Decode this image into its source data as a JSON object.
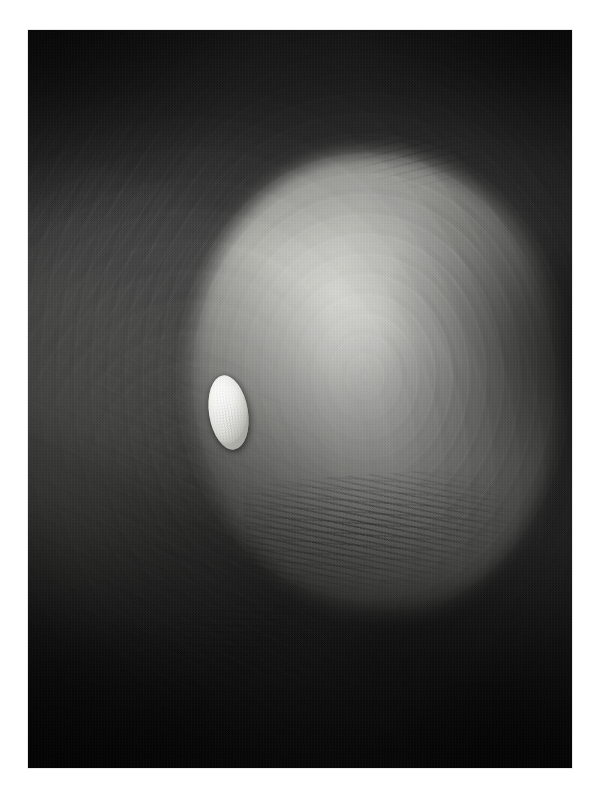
{
  "page": {
    "background_color": "#ffffff",
    "width": 603,
    "height": 795,
    "margins": {
      "left": 28,
      "top": 30,
      "right": 31,
      "bottom": 27
    }
  },
  "artwork": {
    "title": "",
    "medium_appearance": "grayscale photographic reproduction",
    "plate": {
      "x": 28,
      "y": 30,
      "width": 544,
      "height": 738,
      "border_color": "#9a9a9a"
    },
    "palette": {
      "deep_shadow": "#0e0e0e",
      "dark_field": "#242424",
      "mid_gray": "#6a6a67",
      "light_gray": "#aeaea9",
      "highlight_gray": "#d8d8d4",
      "pebble_white": "#ffffff",
      "paper_white": "#ffffff"
    },
    "elements": [
      {
        "name": "dark-upper-field",
        "description": "Deep charcoal field occupying the top third, darkest in both upper corners",
        "tone": "#1d1d1d"
      },
      {
        "name": "bright-lobe",
        "description": "Large rounded luminous mass, right of centre, with a crisp dark rim on its right edge",
        "tone": "#cfcfca",
        "center_pct": {
          "x": 64,
          "y": 48
        },
        "size_pct": {
          "w": 68,
          "h": 62
        }
      },
      {
        "name": "vortex-rings",
        "description": "Concentric elliptical brush-stroke rings sweeping around the hollow",
        "tone": "#555552"
      },
      {
        "name": "lower-left-streaks",
        "description": "Diagonal sweeping light streaks curling through the lower-left quadrant",
        "tone": "#b5b5b0"
      },
      {
        "name": "scratch-marks",
        "description": "Fine dark scratchy striations along the lower arc of the bright lobe",
        "tone": "#1a1a1a"
      },
      {
        "name": "shadow-wedge",
        "description": "Deep black diagonal wedge filling the lower-right corner",
        "tone": "#0a0a0a"
      },
      {
        "name": "white-pebble",
        "description": "Small bright white tilted ellipse floating left of centre, speckled, casting a soft shadow",
        "tone": "#ffffff",
        "center_pct": {
          "x": 37,
          "y": 52
        },
        "size_pct": {
          "w": 7.2,
          "h": 10.2
        },
        "rotation_deg": -9
      }
    ]
  }
}
